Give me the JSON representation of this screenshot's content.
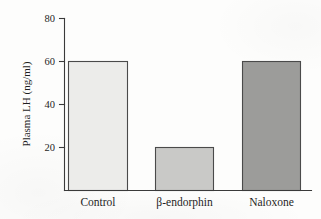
{
  "chart_data": {
    "type": "bar",
    "title": "",
    "subtitle": "",
    "xlabel": "",
    "ylabel": "Plasma LH (ng/ml)",
    "categories": [
      "Control",
      "β-endorphin",
      "Naloxone"
    ],
    "values": [
      60,
      20,
      60
    ],
    "series": [
      {
        "name": "Plasma LH",
        "values": [
          60,
          20,
          60
        ]
      }
    ],
    "ylim": [
      0,
      80
    ],
    "yticks": [
      20,
      40,
      60,
      80
    ],
    "ytick_labels": [
      "20",
      "40",
      "60",
      "80"
    ],
    "grid": false,
    "legend": false,
    "legend_position": "none",
    "bar_colors": [
      "#ececea",
      "#c9c9c7",
      "#9c9c9a"
    ],
    "bar_edge_color": "#4a4a4a",
    "axis_color": "#3a3a3a",
    "background_color": "#fdfdfc",
    "annotations": []
  },
  "axis": {
    "y_title": "Plasma LH (ng/ml)",
    "tick_80": "80",
    "tick_60": "60",
    "tick_40": "40",
    "tick_20": "20"
  },
  "categories": {
    "control": "Control",
    "endorphin": "β-endorphin",
    "naloxone": "Naloxone"
  }
}
